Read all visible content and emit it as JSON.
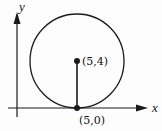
{
  "diagram": {
    "type": "geometry",
    "axes": {
      "x_label": "x",
      "y_label": "y"
    },
    "circle": {
      "center": [
        5,
        4
      ],
      "radius": 4
    },
    "points": [
      {
        "id": "center",
        "label": "(5,4)",
        "coords": [
          5,
          4
        ]
      },
      {
        "id": "tangent",
        "label": "(5,0)",
        "coords": [
          5,
          0
        ]
      }
    ],
    "segments": [
      {
        "from": "center",
        "to": "tangent"
      }
    ],
    "colors": {
      "stroke": "#1a1a1a",
      "background": "#fdfdfd"
    }
  }
}
